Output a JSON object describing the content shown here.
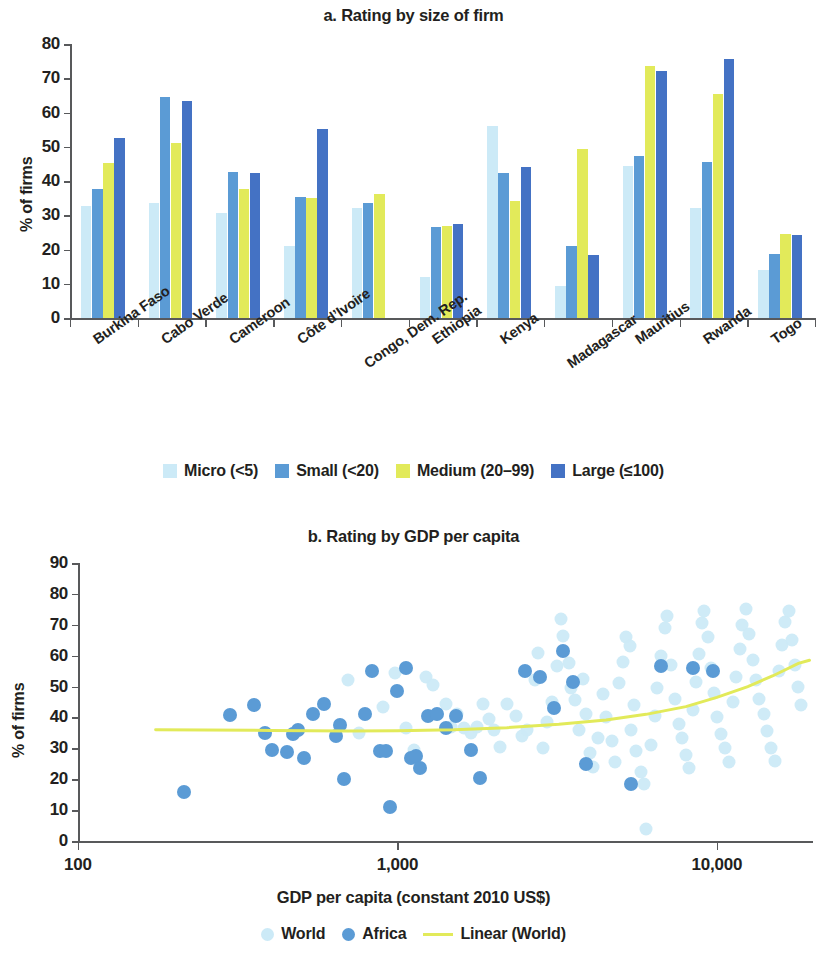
{
  "figure": {
    "panel_a_title": "a. Rating by size of firm",
    "panel_b_title": "b. Rating by GDP per capita"
  },
  "colors": {
    "micro": "#cceaf7",
    "small": "#5b9bd5",
    "medium": "#e2ea5a",
    "large": "#4472c4",
    "world": "#cceaf7",
    "africa": "#5b9bd5",
    "trend": "#e2ea5a",
    "axis": "#58595b",
    "text": "#231f20"
  },
  "chart_data": [
    {
      "type": "bar",
      "title": "a. Rating by size of firm",
      "xlabel": "",
      "ylabel": "% of firms",
      "ylim": [
        0,
        80
      ],
      "yticks": [
        0,
        10,
        20,
        30,
        40,
        50,
        60,
        70,
        80
      ],
      "grid": false,
      "legend_position": "bottom",
      "categories": [
        "Burkina Faso",
        "Cabo Verde",
        "Cameroon",
        "Côte d’Ivoire",
        "Congo, Dem. Rep.",
        "Ethiopia",
        "Kenya",
        "Madagascar",
        "Mauritius",
        "Rwanda",
        "Togo"
      ],
      "series": [
        {
          "name": "Micro (<5)",
          "color": "#cceaf7",
          "values": [
            32.8,
            33.7,
            30.7,
            21.0,
            32.0,
            12.0,
            56.2,
            9.3,
            44.5,
            32.2,
            14.0
          ]
        },
        {
          "name": "Small (<20)",
          "color": "#5b9bd5",
          "values": [
            37.6,
            64.6,
            42.7,
            35.4,
            33.6,
            26.5,
            42.2,
            20.9,
            47.4,
            45.5,
            18.7
          ]
        },
        {
          "name": "Medium (20–99)",
          "color": "#e2ea5a",
          "values": [
            45.4,
            51.0,
            37.7,
            35.1,
            36.2,
            26.9,
            34.2,
            49.3,
            73.5,
            65.5,
            24.4
          ]
        },
        {
          "name": "Large (≤100)",
          "color": "#4472c4",
          "values": [
            52.6,
            63.5,
            42.4,
            55.1,
            0.0,
            27.5,
            44.0,
            18.3,
            72.0,
            75.5,
            24.3
          ]
        }
      ]
    },
    {
      "type": "scatter",
      "title": "b. Rating by GDP per capita",
      "xlabel": "GDP per capita (constant 2010 US$)",
      "ylabel": "% of firms",
      "ylim": [
        0,
        90
      ],
      "yticks": [
        0,
        10,
        20,
        30,
        40,
        50,
        60,
        70,
        80,
        90
      ],
      "xscale": "log",
      "xlim": [
        100,
        20000
      ],
      "xticks": [
        100,
        1000,
        10000
      ],
      "xtick_labels": [
        "100",
        "1,000",
        "10,000"
      ],
      "grid": false,
      "legend_position": "bottom",
      "series": [
        {
          "name": "World",
          "color": "#cceaf7",
          "marker": "circle",
          "points": [
            [
              1230,
              53.0
            ],
            [
              1290,
              50.5
            ],
            [
              1330,
              41.0
            ],
            [
              1420,
              44.5
            ],
            [
              1470,
              37.0
            ],
            [
              1540,
              41.0
            ],
            [
              1620,
              36.5
            ],
            [
              1700,
              35.0
            ],
            [
              1770,
              37.0
            ],
            [
              1850,
              44.5
            ],
            [
              1930,
              39.5
            ],
            [
              2000,
              36.0
            ],
            [
              2100,
              30.5
            ],
            [
              2200,
              44.5
            ],
            [
              2350,
              40.5
            ],
            [
              2450,
              34.0
            ],
            [
              2550,
              36.0
            ],
            [
              2700,
              52.0
            ],
            [
              2750,
              61.0
            ],
            [
              2850,
              30.0
            ],
            [
              2950,
              38.5
            ],
            [
              3050,
              45.0
            ],
            [
              3150,
              56.5
            ],
            [
              3250,
              72.0
            ],
            [
              3300,
              66.5
            ],
            [
              3450,
              57.5
            ],
            [
              3500,
              49.5
            ],
            [
              3600,
              45.5
            ],
            [
              3700,
              36.0
            ],
            [
              3800,
              52.5
            ],
            [
              3900,
              41.0
            ],
            [
              4000,
              28.5
            ],
            [
              4100,
              24.0
            ],
            [
              4250,
              33.5
            ],
            [
              4400,
              47.5
            ],
            [
              4500,
              40.0
            ],
            [
              4700,
              32.5
            ],
            [
              4800,
              25.5
            ],
            [
              4950,
              51.0
            ],
            [
              5100,
              58.0
            ],
            [
              5200,
              66.0
            ],
            [
              5350,
              63.0
            ],
            [
              5400,
              36.0
            ],
            [
              5500,
              44.0
            ],
            [
              5600,
              29.0
            ],
            [
              5800,
              22.5
            ],
            [
              5900,
              18.5
            ],
            [
              6000,
              4.0
            ],
            [
              6200,
              31.0
            ],
            [
              6400,
              40.5
            ],
            [
              6500,
              49.5
            ],
            [
              6700,
              60.0
            ],
            [
              6900,
              69.0
            ],
            [
              7000,
              73.0
            ],
            [
              7200,
              57.0
            ],
            [
              7400,
              46.0
            ],
            [
              7600,
              38.0
            ],
            [
              7800,
              33.5
            ],
            [
              8000,
              28.0
            ],
            [
              8200,
              23.5
            ],
            [
              8400,
              42.5
            ],
            [
              8600,
              51.5
            ],
            [
              8800,
              60.5
            ],
            [
              9000,
              70.5
            ],
            [
              9100,
              74.5
            ],
            [
              9400,
              66.0
            ],
            [
              9600,
              56.0
            ],
            [
              9800,
              48.0
            ],
            [
              10000,
              40.0
            ],
            [
              10300,
              34.5
            ],
            [
              10600,
              30.0
            ],
            [
              10900,
              25.5
            ],
            [
              11200,
              45.0
            ],
            [
              11500,
              53.0
            ],
            [
              11800,
              62.0
            ],
            [
              12000,
              70.0
            ],
            [
              12300,
              75.0
            ],
            [
              12600,
              67.0
            ],
            [
              13000,
              58.5
            ],
            [
              13300,
              52.0
            ],
            [
              13600,
              46.0
            ],
            [
              14000,
              41.0
            ],
            [
              14400,
              35.5
            ],
            [
              14800,
              30.0
            ],
            [
              15200,
              26.0
            ],
            [
              15600,
              55.0
            ],
            [
              16000,
              63.5
            ],
            [
              16300,
              71.0
            ],
            [
              16800,
              74.5
            ],
            [
              17200,
              65.0
            ],
            [
              17600,
              57.0
            ],
            [
              18000,
              50.0
            ],
            [
              18400,
              44.0
            ],
            [
              700,
              52.0
            ],
            [
              760,
              35.0
            ],
            [
              900,
              43.5
            ],
            [
              980,
              54.5
            ],
            [
              1060,
              36.5
            ],
            [
              1130,
              29.5
            ]
          ]
        },
        {
          "name": "Africa",
          "color": "#5b9bd5",
          "marker": "circle",
          "points": [
            [
              215,
              16.0
            ],
            [
              300,
              40.8
            ],
            [
              355,
              44.0
            ],
            [
              385,
              35.0
            ],
            [
              405,
              29.5
            ],
            [
              450,
              28.7
            ],
            [
              470,
              34.8
            ],
            [
              490,
              36.0
            ],
            [
              510,
              26.8
            ],
            [
              545,
              41.0
            ],
            [
              590,
              44.4
            ],
            [
              640,
              34.0
            ],
            [
              660,
              37.5
            ],
            [
              680,
              20.2
            ],
            [
              790,
              41.0
            ],
            [
              830,
              55.0
            ],
            [
              880,
              29.0
            ],
            [
              920,
              29.0
            ],
            [
              950,
              11.0
            ],
            [
              1000,
              48.5
            ],
            [
              1060,
              56.0
            ],
            [
              1100,
              27.0
            ],
            [
              1140,
              27.5
            ],
            [
              1180,
              23.5
            ],
            [
              1250,
              40.5
            ],
            [
              1330,
              41.0
            ],
            [
              1420,
              36.5
            ],
            [
              1520,
              40.5
            ],
            [
              1700,
              29.5
            ],
            [
              1810,
              20.5
            ],
            [
              2500,
              55.0
            ],
            [
              2800,
              53.0
            ],
            [
              3100,
              43.0
            ],
            [
              3300,
              61.5
            ],
            [
              3550,
              51.5
            ],
            [
              3900,
              25.0
            ],
            [
              5400,
              18.5
            ],
            [
              6700,
              56.5
            ],
            [
              8400,
              56.0
            ],
            [
              9700,
              55.0
            ]
          ]
        },
        {
          "name": "Linear (World)",
          "color": "#e2ea5a",
          "type": "line",
          "points": [
            [
              175,
              36.0
            ],
            [
              400,
              35.8
            ],
            [
              700,
              35.6
            ],
            [
              1000,
              35.7
            ],
            [
              1500,
              36.0
            ],
            [
              2200,
              36.7
            ],
            [
              3200,
              37.8
            ],
            [
              4500,
              39.2
            ],
            [
              6000,
              41.0
            ],
            [
              8000,
              43.5
            ],
            [
              10000,
              46.5
            ],
            [
              12500,
              50.0
            ],
            [
              15000,
              53.5
            ],
            [
              18000,
              57.5
            ],
            [
              19500,
              58.5
            ]
          ]
        }
      ]
    }
  ],
  "panel_a": {
    "ylabel": "% of firms",
    "yticks": [
      "80",
      "70",
      "60",
      "50",
      "40",
      "30",
      "20",
      "10",
      "0"
    ],
    "legend": [
      {
        "label": "Micro (<5)",
        "color": "#cceaf7",
        "icon": "square-swatch-icon"
      },
      {
        "label": "Small (<20)",
        "color": "#5b9bd5",
        "icon": "square-swatch-icon"
      },
      {
        "label": "Medium (20–99)",
        "color": "#e2ea5a",
        "icon": "square-swatch-icon"
      },
      {
        "label": "Large (≤100)",
        "color": "#4472c4",
        "icon": "square-swatch-icon"
      }
    ]
  },
  "panel_b": {
    "ylabel": "% of firms",
    "yticks": [
      "90",
      "80",
      "70",
      "60",
      "50",
      "40",
      "30",
      "20",
      "10",
      "0"
    ],
    "xticks": [
      "100",
      "1,000",
      "10,000"
    ],
    "xaxis_title": "GDP per capita (constant 2010 US$)",
    "legend": [
      {
        "label": "World",
        "color": "#cceaf7",
        "icon": "circle-marker-icon"
      },
      {
        "label": "Africa",
        "color": "#5b9bd5",
        "icon": "circle-marker-icon"
      },
      {
        "label": "Linear (World)",
        "color": "#e2ea5a",
        "icon": "line-marker-icon"
      }
    ]
  }
}
